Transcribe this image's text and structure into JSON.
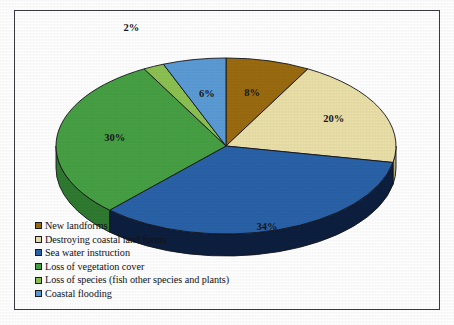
{
  "chart_data": {
    "type": "pie",
    "title": "",
    "three_d": true,
    "start_angle_deg": 0,
    "direction": "clockwise",
    "categories": [
      "New landforms",
      "Destroying coastal land forms",
      "Sea water instruction",
      "Loss of vegetation cover",
      "Loss of species (fish other species and plants)",
      "Coastal flooding"
    ],
    "values": [
      8,
      20,
      34,
      30,
      2,
      6
    ],
    "value_unit": "%",
    "data_labels": [
      "8%",
      "20%",
      "34%",
      "30%",
      "2%",
      "6%"
    ],
    "colors": [
      "#9a6b10",
      "#eadfa8",
      "#2a62a8",
      "#46a043",
      "#8cc152",
      "#5b9bd5"
    ],
    "side_colors": [
      "#6d4a0a",
      "#b7ab76",
      "#0d1f3e",
      "#2f7a30",
      "#6a9a38",
      "#3d6f9e"
    ],
    "legend_position": "bottom-left",
    "xlabel": "",
    "ylabel": "",
    "grid": false
  },
  "legend": {
    "items": [
      {
        "label": "New landforms",
        "color": "#9a6b10"
      },
      {
        "label": "Destroying coastal land forms",
        "color": "#eadfa8"
      },
      {
        "label": "Sea water instruction",
        "color": "#2a62a8"
      },
      {
        "label": "Loss of vegetation cover",
        "color": "#46a043"
      },
      {
        "label": "Loss of species (fish other species and plants)",
        "color": "#8cc152"
      },
      {
        "label": "Coastal flooding",
        "color": "#5b9bd5"
      }
    ]
  },
  "labels": {
    "slice_0": "8%",
    "slice_1": "20%",
    "slice_2": "34%",
    "slice_3": "30%",
    "slice_4": "2%",
    "slice_5": "6%"
  },
  "style": {
    "border_color": "#3a3a40",
    "background": "#ffffff",
    "label_color": "#17171c"
  }
}
